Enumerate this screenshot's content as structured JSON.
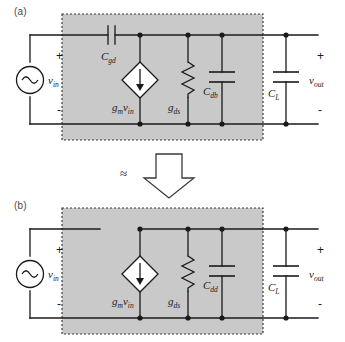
{
  "figure": {
    "type": "circuit-schematic",
    "panels": [
      {
        "tag": "(a)",
        "source": {
          "label": "v",
          "sub": "in",
          "plus": "+",
          "minus": "-",
          "icon": "ac-source-icon"
        },
        "components": [
          {
            "name": "C_gd",
            "label": "C",
            "sub": "gd",
            "kind": "capacitor",
            "orientation": "series-horizontal"
          },
          {
            "name": "gm_vin",
            "label": "g",
            "sub": "m",
            "label2": "v",
            "sub2": "in",
            "kind": "dependent-current-source"
          },
          {
            "name": "g_ds",
            "label": "g",
            "sub": "ds",
            "kind": "resistor"
          },
          {
            "name": "C_db",
            "label": "C",
            "sub": "db",
            "kind": "capacitor"
          },
          {
            "name": "C_L",
            "label": "C",
            "sub": "L",
            "kind": "capacitor",
            "inside_box": false
          }
        ],
        "output": {
          "label": "v",
          "sub": "out",
          "plus": "+",
          "minus": "-"
        }
      },
      {
        "tag": "(b)",
        "source": {
          "label": "v",
          "sub": "in",
          "plus": "+",
          "minus": "-",
          "icon": "ac-source-icon"
        },
        "components": [
          {
            "name": "gm_vin",
            "label": "g",
            "sub": "m",
            "label2": "v",
            "sub2": "in",
            "kind": "dependent-current-source"
          },
          {
            "name": "g_ds",
            "label": "g",
            "sub": "ds",
            "kind": "resistor"
          },
          {
            "name": "C_dd",
            "label": "C",
            "sub": "dd",
            "kind": "capacitor"
          },
          {
            "name": "C_L",
            "label": "C",
            "sub": "L",
            "kind": "capacitor",
            "inside_box": false
          }
        ],
        "output": {
          "label": "v",
          "sub": "out",
          "plus": "+",
          "minus": "-"
        }
      }
    ],
    "bridge": {
      "approx_symbol": "≈",
      "arrow": "down-arrow-icon"
    },
    "colors": {
      "box_fill": "#c9c9c9",
      "box_border": "#3a3a3a",
      "wire": "#1a1a1a",
      "text": "#1a1a1a",
      "tag_text": "#4a4a4a",
      "shape_fill": "#ffffff"
    }
  }
}
